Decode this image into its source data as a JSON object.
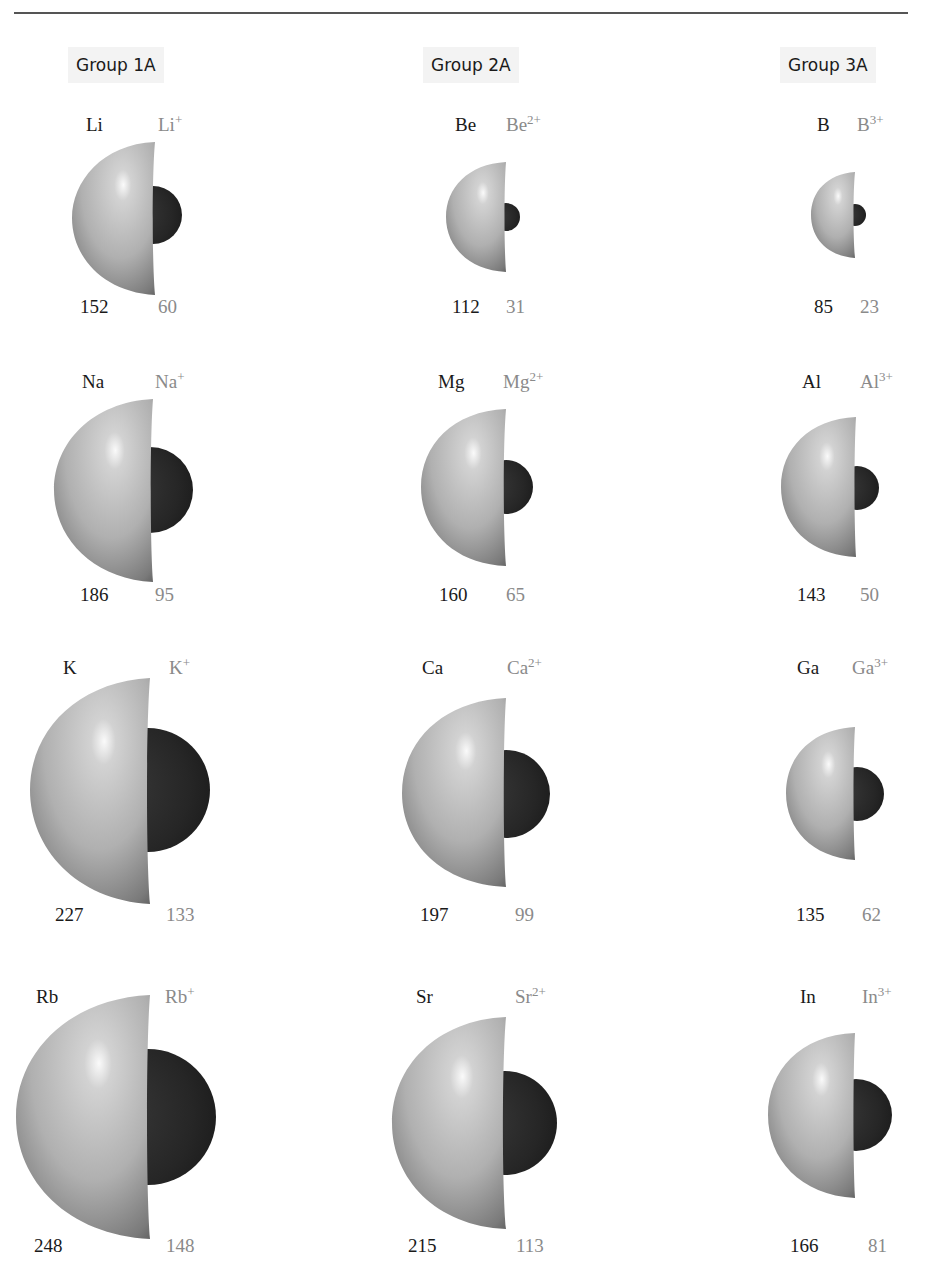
{
  "header": {
    "rule": true
  },
  "groups": [
    {
      "label": "Group 1A"
    },
    {
      "label": "Group 2A"
    },
    {
      "label": "Group 3A"
    }
  ],
  "colors": {
    "atom": "#b8b8b8",
    "atom_highlight": "#f2f2f2",
    "atom_shadow": "#6a6a6a",
    "ion": "#2e2e2e",
    "ion_label": "#8a8a8a",
    "atom_label": "#1a1a1a",
    "group_label_bg": "#f3f3f3"
  },
  "units": "pm",
  "rows": [
    [
      {
        "atom": "Li",
        "ion": "Li",
        "charge": "+",
        "atom_radius": "152",
        "ion_radius": "60"
      },
      {
        "atom": "Be",
        "ion": "Be",
        "charge": "2+",
        "atom_radius": "112",
        "ion_radius": "31"
      },
      {
        "atom": "B",
        "ion": "B",
        "charge": "3+",
        "atom_radius": "85",
        "ion_radius": "23"
      }
    ],
    [
      {
        "atom": "Na",
        "ion": "Na",
        "charge": "+",
        "atom_radius": "186",
        "ion_radius": "95"
      },
      {
        "atom": "Mg",
        "ion": "Mg",
        "charge": "2+",
        "atom_radius": "160",
        "ion_radius": "65"
      },
      {
        "atom": "Al",
        "ion": "Al",
        "charge": "3+",
        "atom_radius": "143",
        "ion_radius": "50"
      }
    ],
    [
      {
        "atom": "K",
        "ion": "K",
        "charge": "+",
        "atom_radius": "227",
        "ion_radius": "133"
      },
      {
        "atom": "Ca",
        "ion": "Ca",
        "charge": "2+",
        "atom_radius": "197",
        "ion_radius": "99"
      },
      {
        "atom": "Ga",
        "ion": "Ga",
        "charge": "3+",
        "atom_radius": "135",
        "ion_radius": "62"
      }
    ],
    [
      {
        "atom": "Rb",
        "ion": "Rb",
        "charge": "+",
        "atom_radius": "248",
        "ion_radius": "148"
      },
      {
        "atom": "Sr",
        "ion": "Sr",
        "charge": "2+",
        "atom_radius": "215",
        "ion_radius": "113"
      },
      {
        "atom": "In",
        "ion": "In",
        "charge": "3+",
        "atom_radius": "166",
        "ion_radius": "81"
      }
    ]
  ]
}
